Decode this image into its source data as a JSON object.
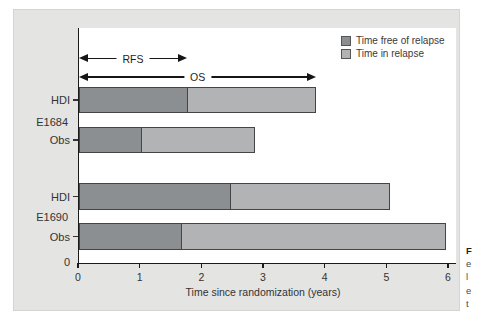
{
  "figure": {
    "group_labels": [
      "E1684",
      "E1690"
    ],
    "row_labels": [
      "HDI",
      "Obs",
      "HDI",
      "Obs"
    ],
    "y_origin_label": "0"
  },
  "caption": {
    "fragments": [
      "F",
      "e",
      "l",
      "e",
      "t"
    ]
  },
  "chart_data": {
    "type": "bar",
    "orientation": "horizontal",
    "stacked": true,
    "title": "",
    "xlabel": "Time since randomization (years)",
    "ylabel": "",
    "xlim": [
      0,
      6
    ],
    "x_ticks": [
      0,
      1,
      2,
      3,
      4,
      5,
      6
    ],
    "grid": false,
    "legend_position": "top-right",
    "groups": [
      "E1684",
      "E1690"
    ],
    "categories": [
      "E1684 HDI",
      "E1684 Obs",
      "E1690 HDI",
      "E1690 Obs"
    ],
    "series": [
      {
        "name": "Time free of relapse",
        "color": "#8c8f91",
        "values": [
          1.75,
          1.0,
          2.45,
          1.65
        ]
      },
      {
        "name": "Time in relapse",
        "color": "#b1b3b4",
        "values": [
          2.1,
          1.85,
          2.6,
          4.3
        ]
      }
    ],
    "bar_totals_overall_survival_years": [
      3.85,
      2.85,
      5.05,
      5.95
    ],
    "annotations": [
      {
        "label": "RFS",
        "x_from": 0,
        "x_to": 1.75
      },
      {
        "label": "OS",
        "x_from": 0,
        "x_to": 3.85
      }
    ]
  }
}
